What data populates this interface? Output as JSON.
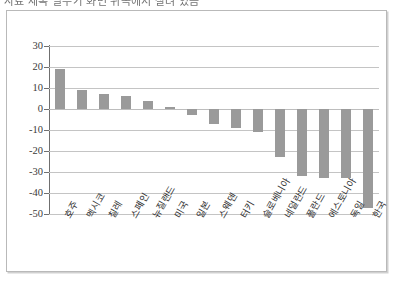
{
  "title_clipped": "자료 제목 일부가 화면 위쪽에서 잘려 있음",
  "chart_data": {
    "type": "bar",
    "title": "",
    "subtitle": "",
    "xlabel": "",
    "ylabel": "",
    "ylim": [
      -50,
      30
    ],
    "ytick_step": 10,
    "grid": true,
    "legend": false,
    "bar_color": "#9a9a9a",
    "categories": [
      "호주",
      "멕시코",
      "칠레",
      "스페인",
      "뉴질랜드",
      "미국",
      "일본",
      "스웨덴",
      "터키",
      "슬로베니아",
      "네덜란드",
      "폴란드",
      "에스토니아",
      "독일",
      "한국"
    ],
    "values": [
      19,
      9,
      7,
      6,
      4,
      1,
      -3,
      -7,
      -9,
      -11,
      -23,
      -32,
      -33,
      -33,
      -47
    ],
    "ytick_labels": [
      "30",
      "20",
      "10",
      "0",
      "-10",
      "-20",
      "-30",
      "-40",
      "-50"
    ],
    "ytick_values": [
      30,
      20,
      10,
      0,
      -10,
      -20,
      -30,
      -40,
      -50
    ]
  }
}
